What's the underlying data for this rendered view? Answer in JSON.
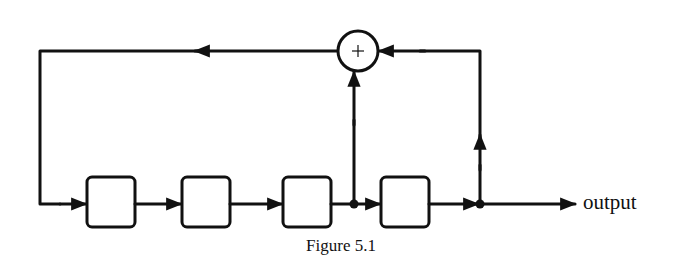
{
  "figure": {
    "caption": "Figure 5.1",
    "output_label": "output",
    "adder_symbol": "+",
    "line_color": "#111111",
    "background": "#ffffff"
  },
  "diagram": {
    "type": "linear feedback shift register",
    "registers": [
      {
        "id": "r1",
        "x": 87,
        "y": 177,
        "w": 48,
        "h": 50
      },
      {
        "id": "r2",
        "x": 182,
        "y": 177,
        "w": 48,
        "h": 50
      },
      {
        "id": "r3",
        "x": 283,
        "y": 177,
        "w": 48,
        "h": 50
      },
      {
        "id": "r4",
        "x": 381,
        "y": 177,
        "w": 48,
        "h": 50
      }
    ],
    "adder": {
      "cx": 358,
      "cy": 51,
      "r": 20
    },
    "taps": [
      {
        "after": "r3",
        "x": 354,
        "y": 204
      },
      {
        "after": "r4",
        "x": 480,
        "y": 204
      }
    ],
    "feedback_line_y": 51,
    "shift_line_y": 204,
    "left_return_x": 40,
    "output_end_x": 575
  }
}
